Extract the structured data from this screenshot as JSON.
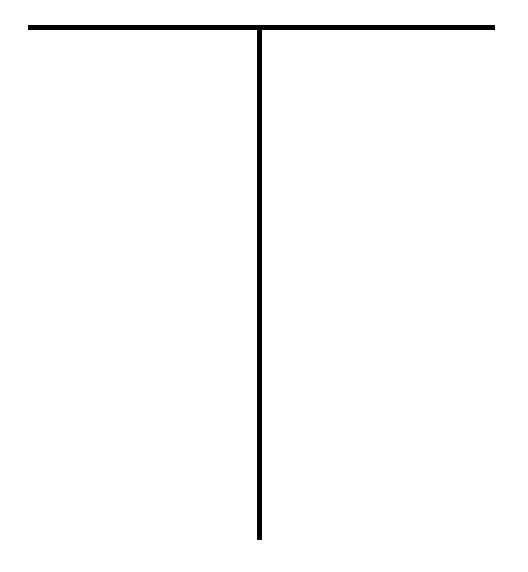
{
  "page": {
    "background": "#ffffff",
    "line_color": "#000000"
  },
  "header_fragments": {
    "note": "",
    "left": "",
    "right": ""
  },
  "t_chart": {
    "left_column": {
      "heading": "",
      "items": []
    },
    "right_column": {
      "heading": "",
      "items": []
    }
  }
}
